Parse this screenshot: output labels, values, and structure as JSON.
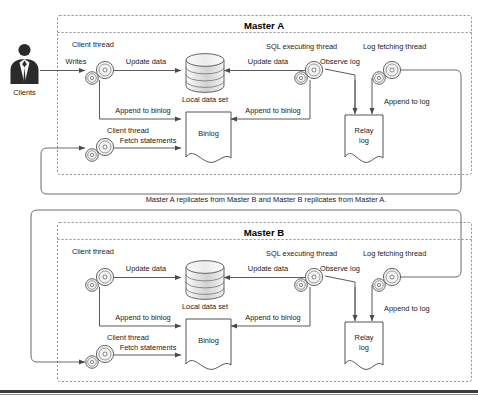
{
  "figure": {
    "type": "architecture-diagram",
    "middle_note": "Master A replicates from Master B and Master B replicates from Master A."
  },
  "actor": {
    "label": "Clients",
    "icon": "person-silhouette-icon"
  },
  "masters": [
    {
      "id": "master-a",
      "title": "Master A",
      "thread_labels": {
        "client_thread_top": "Client thread",
        "client_thread_bottom": "Client thread",
        "sql_executing_thread": "SQL executing thread",
        "log_fetching_thread": "Log fetching thread"
      },
      "nodes": {
        "data_set": "Local data set",
        "binlog": "Binlog",
        "relay_log_line1": "Relay",
        "relay_log_line2": "log"
      },
      "edges": {
        "writes": "Writes",
        "update_data_left": "Update data",
        "update_data_right": "Update data",
        "observe_log": "Observe log",
        "append_to_binlog_left": "Append to binlog",
        "append_to_binlog_right": "Append to binlog",
        "append_to_log": "Append to log",
        "fetch_statements": "Fetch statements"
      }
    },
    {
      "id": "master-b",
      "title": "Master B",
      "thread_labels": {
        "client_thread_top": "Client thread",
        "client_thread_bottom": "Client thread",
        "sql_executing_thread": "SQL executing thread",
        "log_fetching_thread": "Log fetching thread"
      },
      "nodes": {
        "data_set": "Local data set",
        "binlog": "Binlog",
        "relay_log_line1": "Relay",
        "relay_log_line2": "log"
      },
      "edges": {
        "update_data_left": "Update data",
        "update_data_right": "Update data",
        "observe_log": "Observe log",
        "append_to_binlog_left": "Append to binlog",
        "append_to_binlog_right": "Append to binlog",
        "append_to_log": "Append to log",
        "fetch_statements": "Fetch statements"
      }
    }
  ],
  "colors": {
    "page_background": "#ffffff",
    "line": "#5a5a5a",
    "dashed_border": "#8a8a8a",
    "text": "#1a1a1a",
    "person": "#2b2b2b",
    "bottom_bar": "#3d3d3d"
  }
}
